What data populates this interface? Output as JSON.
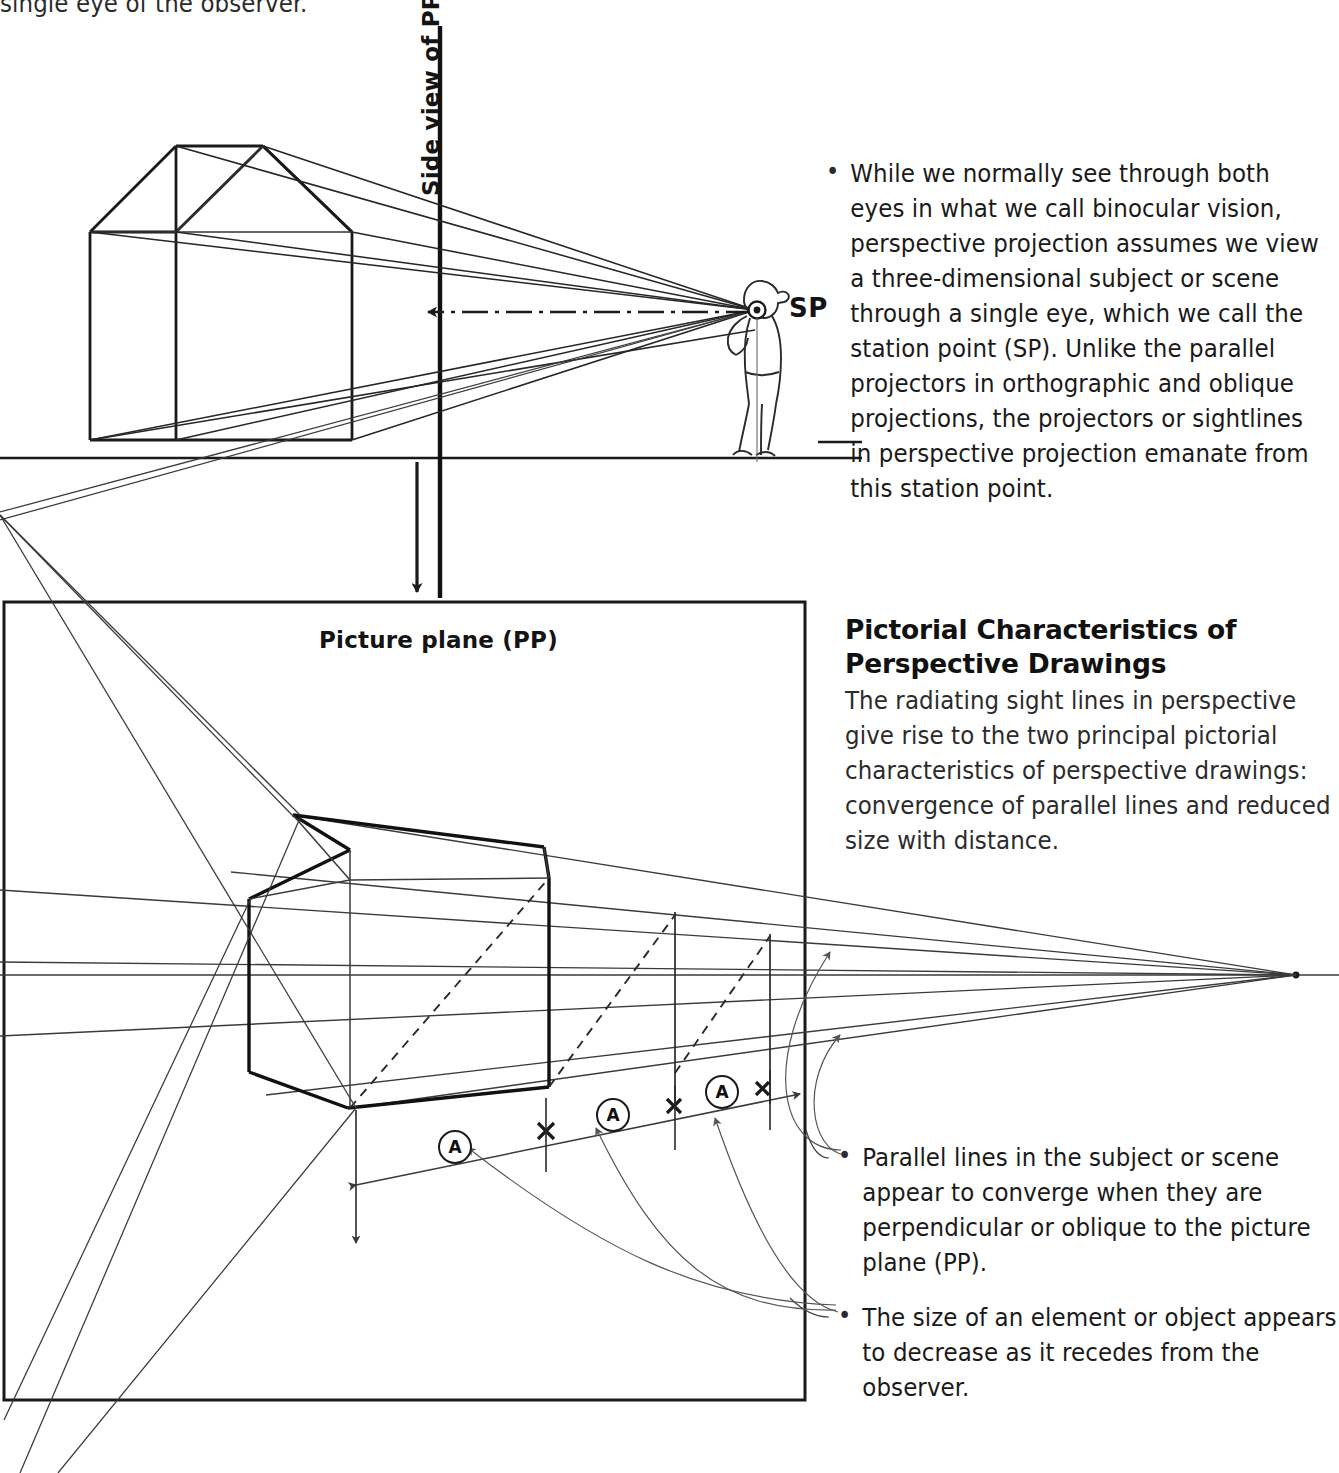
{
  "page": {
    "width": 1339,
    "height": 1473,
    "background": "#ffffff",
    "ink": "#1a1a1a"
  },
  "top_cutoff_text": "single eye of the observer.",
  "diagram_top": {
    "pp_label": "Side view of PP",
    "station_point_label": "SP",
    "caption": {
      "bullet": "•",
      "text": "While we normally see through both eyes in what we call binocular vision, perspective projection assumes we view a three-dimensional subject or scene through a single eye, which we call the station point (SP). Unlike the parallel projectors in orthographic and oblique projections, the projectors or sightlines in perspective projection emanate from this station point."
    }
  },
  "diagram_bottom": {
    "pp_label": "Picture plane (PP)",
    "dimension_markers": [
      "A",
      "A",
      "A"
    ],
    "section": {
      "heading": "Pictorial Characteristics of Perspective Drawings",
      "text": "The radiating sight lines in perspective give rise to the two principal pictorial characteristics of perspective drawings: convergence of parallel lines and reduced size with distance."
    },
    "callouts": [
      {
        "bullet": "•",
        "text": "Parallel lines in the subject or scene appear to converge when they are perpendicular or oblique to the picture plane (PP)."
      },
      {
        "bullet": "•",
        "text": "The size of an element or object appears to decrease as it recedes from the observer."
      }
    ]
  }
}
